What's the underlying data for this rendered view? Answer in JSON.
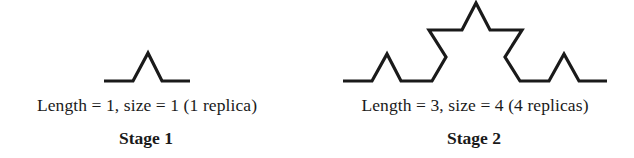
{
  "figure": {
    "stroke_color": "#1a1a1a",
    "background_color": "#ffffff",
    "stages": [
      {
        "title": "Stage 1",
        "caption": "Length = 1, size = 1 (1 replica)",
        "length": 1,
        "size": 1,
        "replicas": 1,
        "curve_points": "104,81 133,81 148,53 162,81 190,81"
      },
      {
        "title": "Stage 2",
        "caption": "Length = 3, size = 4 (4 replicas)",
        "length": 3,
        "size": 4,
        "replicas": 4,
        "curve_points": "343,81 372,81 387,54 401,81 432,81 446,57 429,30 462,30 476,3 490,30 522,30 505,57 520,81 549,81 564,54 579,81 607,81"
      }
    ]
  }
}
